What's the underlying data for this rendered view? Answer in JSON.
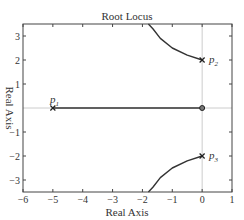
{
  "chart_data": {
    "type": "line",
    "title": "Root Locus",
    "xlabel": "Real Axis",
    "ylabel": "Real Axis",
    "xlim": [
      -6,
      1
    ],
    "ylim": [
      -3.5,
      3.5
    ],
    "xticks": [
      -6,
      -5,
      -4,
      -3,
      -2,
      -1,
      0,
      1
    ],
    "yticks": [
      -3,
      -2,
      -1,
      1,
      2,
      3
    ],
    "grid": "zero-lines only",
    "legend": null,
    "poles": [
      {
        "name": "p1",
        "x": -5,
        "y": 0
      },
      {
        "name": "p2",
        "x": 0,
        "y": 2
      },
      {
        "name": "p3",
        "x": 0,
        "y": -2
      }
    ],
    "zeros": [
      {
        "x": 0,
        "y": 0
      }
    ],
    "series": [
      {
        "name": "branch-real",
        "points": [
          [
            -5,
            0
          ],
          [
            0,
            0
          ]
        ]
      },
      {
        "name": "branch-upper",
        "points": [
          [
            0,
            2
          ],
          [
            -0.5,
            2.2
          ],
          [
            -1.0,
            2.5
          ],
          [
            -1.4,
            2.9
          ],
          [
            -1.65,
            3.3
          ],
          [
            -1.8,
            3.5
          ]
        ]
      },
      {
        "name": "branch-lower",
        "points": [
          [
            0,
            -2
          ],
          [
            -0.5,
            -2.2
          ],
          [
            -1.0,
            -2.5
          ],
          [
            -1.4,
            -2.9
          ],
          [
            -1.65,
            -3.3
          ],
          [
            -1.8,
            -3.5
          ]
        ]
      }
    ]
  },
  "labels": {
    "title": "Root Locus",
    "xlabel": "Real Axis",
    "ylabel": "Real Axis",
    "p1": "p",
    "p1_sub": "1",
    "p2": "p",
    "p2_sub": "2",
    "p3": "p",
    "p3_sub": "3"
  }
}
